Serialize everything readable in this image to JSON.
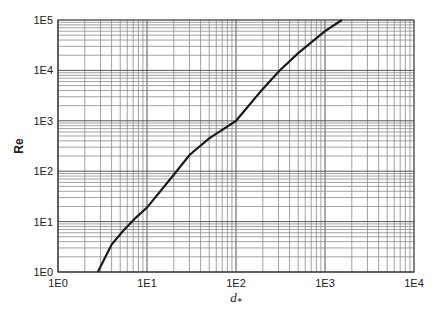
{
  "chart_data": {
    "type": "line",
    "title": "",
    "xlabel": "d*",
    "ylabel": "Re",
    "xscale": "log",
    "yscale": "log",
    "xlim": [
      1,
      10000
    ],
    "ylim": [
      1,
      100000
    ],
    "grid": true,
    "legend": null,
    "x_tick_labels": [
      "1E0",
      "1E1",
      "1E2",
      "1E3",
      "1E4"
    ],
    "y_tick_labels": [
      "1E0",
      "1E1",
      "1E2",
      "1E3",
      "1E4",
      "1E5"
    ],
    "series": [
      {
        "name": "Re vs d*",
        "x": [
          2.8,
          4,
          5.5,
          7.5,
          10,
          20,
          30,
          50,
          100,
          200,
          310,
          500,
          1000,
          1550
        ],
        "y": [
          1,
          3.5,
          6.8,
          12,
          19,
          85,
          210,
          450,
          1000,
          4300,
          10000,
          22000,
          60000,
          100000
        ]
      }
    ]
  },
  "axes": {
    "xlabel_main": "d",
    "xlabel_sub": "*",
    "ylabel": "Re"
  }
}
